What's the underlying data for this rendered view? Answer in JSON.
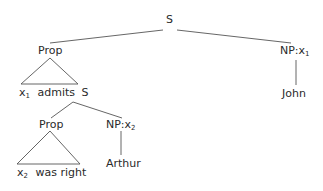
{
  "tree": {
    "root": {
      "label": "S"
    },
    "prop1": {
      "label": "Prop"
    },
    "np1": {
      "label": "NP:",
      "var": "x",
      "sub": "1"
    },
    "leaf1": {
      "var": "x",
      "sub": "1",
      "text": "admits",
      "s": "S"
    },
    "john": {
      "label": "John"
    },
    "prop2": {
      "label": "Prop"
    },
    "np2": {
      "label": "NP:",
      "var": "x",
      "sub": "2"
    },
    "leaf2": {
      "var": "x",
      "sub": "2",
      "text": "was right"
    },
    "arthur": {
      "label": "Arthur"
    }
  },
  "colors": {
    "line": "#555555",
    "text": "#2a2a2a"
  }
}
